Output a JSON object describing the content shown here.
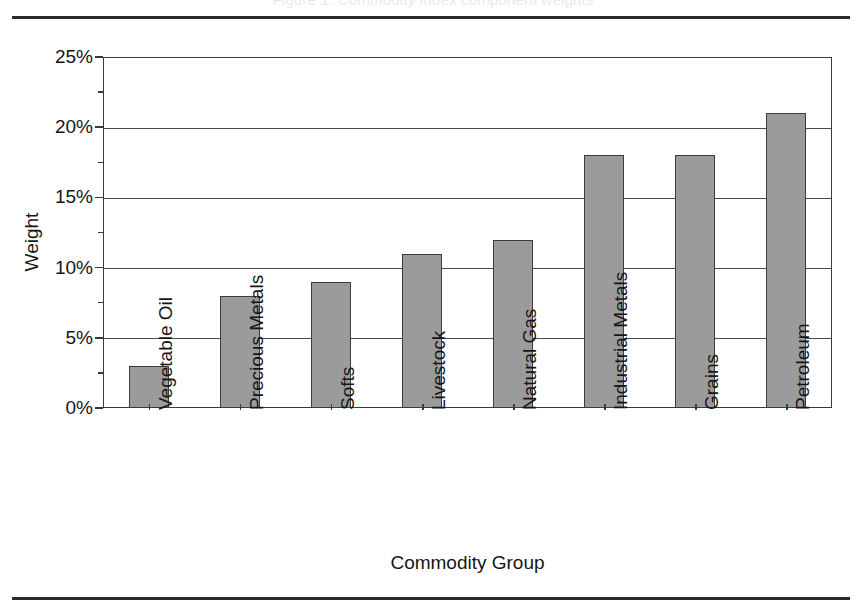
{
  "figure": {
    "title_remnant": "Figure 1. Commodity index component weights",
    "rules": {
      "top_label": "page-rule-top",
      "bottom_label": "page-rule-bottom"
    }
  },
  "chart_data": {
    "type": "bar",
    "title": "",
    "xlabel": "Commodity Group",
    "ylabel": "Weight",
    "categories": [
      "Vegetable Oil",
      "Precious Metals",
      "Softs",
      "Livestock",
      "Natural Gas",
      "Industrial Metals",
      "Grains",
      "Petroleum"
    ],
    "values": [
      3,
      8,
      9,
      11,
      12,
      18,
      18,
      21
    ],
    "ylim": [
      0,
      25
    ],
    "ytick_values": [
      0,
      5,
      10,
      15,
      20,
      25
    ],
    "ytick_labels": [
      "0%",
      "5%",
      "10%",
      "15%",
      "20%",
      "25%"
    ],
    "y_unit": "%",
    "grid": true,
    "legend": false,
    "bar_color": "#9b9b9b",
    "bar_edge_color": "#3c3c3c",
    "axis_color": "#3a3a3a",
    "background": "#ffffff"
  }
}
